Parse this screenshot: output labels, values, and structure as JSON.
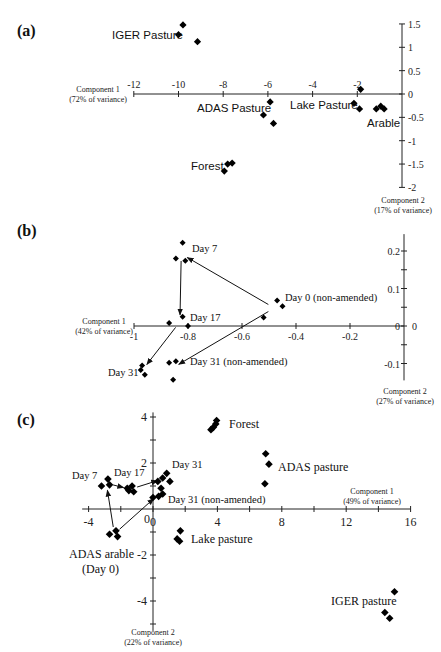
{
  "chart_data": [
    {
      "panel": "(a)",
      "type": "scatter",
      "title": "",
      "xlabel": "Component 1",
      "xlabel_sub": "(72% of variance)",
      "ylabel": "Component 2",
      "ylabel_sub": "(17% of variance)",
      "xlim": [
        -12,
        0
      ],
      "ylim": [
        -2,
        1.5
      ],
      "xticks": [
        "-12",
        "-10",
        "-8",
        "-6",
        "-4",
        "-2"
      ],
      "yticks": [
        "1.5",
        "1",
        "0.5",
        "0",
        "-0.5",
        "-1",
        "-1.5",
        "-2"
      ],
      "grid": false,
      "series": [
        {
          "name": "IGER Pasture",
          "points": [
            [
              -10.0,
              1.27
            ],
            [
              -9.8,
              1.48
            ],
            [
              -9.15,
              1.12
            ]
          ]
        },
        {
          "name": "ADAS Pasture",
          "points": [
            [
              -5.9,
              -0.17
            ],
            [
              -6.2,
              -0.45
            ],
            [
              -5.75,
              -0.63
            ]
          ]
        },
        {
          "name": "Lake Pasture",
          "points": [
            [
              -2.15,
              -0.2
            ],
            [
              -1.9,
              -0.32
            ]
          ]
        },
        {
          "name": "Arable",
          "points": [
            [
              -1.85,
              0.1
            ],
            [
              -1.15,
              -0.32
            ],
            [
              -0.95,
              -0.26
            ],
            [
              -0.8,
              -0.32
            ]
          ]
        },
        {
          "name": "Forest",
          "points": [
            [
              -7.95,
              -1.65
            ],
            [
              -7.8,
              -1.5
            ],
            [
              -7.6,
              -1.48
            ]
          ]
        }
      ]
    },
    {
      "panel": "(b)",
      "type": "scatter",
      "title": "",
      "xlabel": "Component 1",
      "xlabel_sub": "(42% of variance)",
      "ylabel": "Component 2",
      "ylabel_sub": "(27% of variance)",
      "xlim": [
        -1,
        0
      ],
      "ylim": [
        -0.15,
        0.25
      ],
      "xticks": [
        "-1",
        "-0.8",
        "-0.6",
        "-0.4",
        "-0.2"
      ],
      "yticks": [
        "0.2",
        "0.1",
        "0",
        "-0.1"
      ],
      "grid": false,
      "series": [
        {
          "name": "Day 7",
          "points": [
            [
              -0.82,
              0.222
            ],
            [
              -0.845,
              0.18
            ],
            [
              -0.81,
              0.174
            ]
          ]
        },
        {
          "name": "Day 17",
          "points": [
            [
              -0.82,
              0.025
            ],
            [
              -0.87,
              0.008
            ],
            [
              -0.8,
              0.0
            ]
          ]
        },
        {
          "name": "Day 0 (non-amended)",
          "points": [
            [
              -0.47,
              0.068
            ],
            [
              -0.45,
              0.053
            ],
            [
              -0.52,
              0.023
            ]
          ]
        },
        {
          "name": "Day 31",
          "points": [
            [
              -0.97,
              -0.105
            ],
            [
              -0.975,
              -0.117
            ],
            [
              -0.96,
              -0.13
            ]
          ]
        },
        {
          "name": "Day 31 (non-amended)",
          "points": [
            [
              -0.87,
              -0.098
            ],
            [
              -0.845,
              -0.094
            ],
            [
              -0.855,
              -0.143
            ]
          ]
        }
      ],
      "arrows": [
        {
          "from": "Day 0 (non-amended)",
          "to": "Day 7"
        },
        {
          "from": "Day 7",
          "to": "Day 17"
        },
        {
          "from": "Day 17",
          "to": "Day 31"
        },
        {
          "from": "Day 0 (non-amended)",
          "to": "Day 31 (non-amended)"
        }
      ]
    },
    {
      "panel": "(c)",
      "type": "scatter",
      "title": "",
      "xlabel": "Component 1",
      "xlabel_sub": "(49% of variance)",
      "ylabel": "Component 2",
      "ylabel_sub": "(22% of variance)",
      "xlim": [
        -4,
        16
      ],
      "ylim": [
        -5,
        4
      ],
      "xticks": [
        "-4",
        "0",
        "4",
        "8",
        "12",
        "16"
      ],
      "yticks": [
        "4",
        "2",
        "-2",
        "-4"
      ],
      "grid": false,
      "series": [
        {
          "name": "Forest",
          "points": [
            [
              3.6,
              3.45
            ],
            [
              3.75,
              3.55
            ],
            [
              3.9,
              3.7
            ],
            [
              3.95,
              3.85
            ]
          ]
        },
        {
          "name": "ADAS pasture",
          "points": [
            [
              7.0,
              2.4
            ],
            [
              7.2,
              1.95
            ],
            [
              6.95,
              1.1
            ]
          ]
        },
        {
          "name": "Lake pasture",
          "points": [
            [
              1.7,
              -0.95
            ],
            [
              1.5,
              -1.3
            ],
            [
              1.65,
              -1.4
            ]
          ]
        },
        {
          "name": "IGER pasture",
          "points": [
            [
              15.0,
              -3.6
            ],
            [
              14.4,
              -4.5
            ],
            [
              14.7,
              -4.75
            ]
          ]
        },
        {
          "name": "ADAS arable (Day 0)",
          "points": [
            [
              -2.7,
              -1.1
            ],
            [
              -2.3,
              -0.95
            ],
            [
              -2.2,
              -1.2
            ]
          ]
        },
        {
          "name": "Day 7",
          "points": [
            [
              -3.2,
              1.0
            ],
            [
              -2.8,
              1.3
            ],
            [
              -2.7,
              1.05
            ]
          ]
        },
        {
          "name": "Day 17",
          "points": [
            [
              -1.5,
              0.8
            ],
            [
              -1.3,
              1.0
            ],
            [
              -1.2,
              0.75
            ],
            [
              -1.6,
              0.9
            ]
          ]
        },
        {
          "name": "Day 31",
          "points": [
            [
              0.6,
              1.35
            ],
            [
              0.85,
              1.55
            ],
            [
              1.05,
              1.2
            ],
            [
              0.3,
              1.2
            ]
          ]
        },
        {
          "name": "Day 31 (non-amended)",
          "points": [
            [
              0.0,
              0.5
            ],
            [
              0.35,
              0.55
            ],
            [
              0.6,
              0.65
            ],
            [
              0.5,
              0.9
            ]
          ]
        }
      ],
      "arrows": [
        {
          "from": "ADAS arable (Day 0)",
          "to": "Day 7"
        },
        {
          "from": "Day 7",
          "to": "Day 17"
        },
        {
          "from": "Day 17",
          "to": "Day 31"
        },
        {
          "from": "ADAS arable (Day 0)",
          "to": "Day 31 (non-amended)"
        }
      ]
    }
  ],
  "panels": {
    "a": {
      "label": "(a)",
      "x_title": "Component 1",
      "x_sub": "(72% of variance)",
      "y_title": "Component 2",
      "y_sub": "(17% of variance)",
      "labels": {
        "iger": "IGER Pasture",
        "adas": "ADAS Pasture",
        "lake": "Lake Pasture",
        "arable": "Arable",
        "forest": "Forest"
      }
    },
    "b": {
      "label": "(b)",
      "x_title": "Component 1",
      "x_sub": "(42% of variance)",
      "y_title": "Component 2",
      "y_sub": "(27% of variance)",
      "labels": {
        "day7": "Day 7",
        "day17": "Day 17",
        "day0": "Day 0 (non-amended)",
        "day31": "Day 31",
        "day31n": "Day 31 (non-amended)"
      }
    },
    "c": {
      "label": "(c)",
      "x_title": "Component 1",
      "x_sub": "(49% of variance)",
      "y_title": "Component 2",
      "y_sub": "(22% of variance)",
      "labels": {
        "forest": "Forest",
        "adas": "ADAS pasture",
        "lake": "Lake pasture",
        "iger": "IGER pasture",
        "arable1": "ADAS arable",
        "arable2": "(Day 0)",
        "day7": "Day 7",
        "day17": "Day 17",
        "day31": "Day 31",
        "day31n": "Day 31 (non-amended)"
      }
    }
  }
}
